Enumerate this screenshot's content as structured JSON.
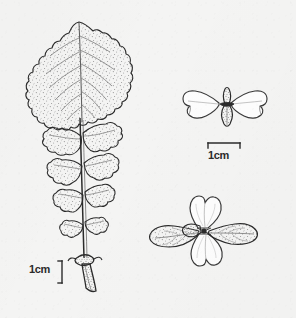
{
  "plate": {
    "title": "Botanical line illustration plate",
    "background_color": "#f4f4f3",
    "ink_color": "#2b2b2b",
    "stipple_color": "#8d8d8d",
    "vein_color": "#6f6f6f",
    "width_px": 296,
    "height_px": 318
  },
  "figures": [
    {
      "id": "leaf",
      "name": "lyrate-pinnatifid-leaf",
      "description": "Large lyrate pinnatifid leaf with big terminal lobe, several opposite pairs of smaller lateral lobes along a winged rachis, and a stout petiole with a basal node",
      "position": "left"
    },
    {
      "id": "flower-side",
      "name": "flower-side-view",
      "description": "Flower in lateral view: two opposite wing-like petals, each deeply notched at the apex, with a stippled calyx and bract at the centre",
      "position": "upper-right"
    },
    {
      "id": "flower-face",
      "name": "flower-face-view",
      "description": "Flower in face view: two heart-shaped notched petals above and below, two stippled leafy bracts spreading laterally",
      "position": "lower-right"
    }
  ],
  "scalebars": [
    {
      "id": "scalebar-left",
      "label": "1cm",
      "orientation": "vertical",
      "bracket": "right-facing",
      "applies_to": "leaf"
    },
    {
      "id": "scalebar-right",
      "label": "1cm",
      "orientation": "horizontal",
      "bracket": "downward-ticks",
      "applies_to": "flower-side"
    }
  ]
}
